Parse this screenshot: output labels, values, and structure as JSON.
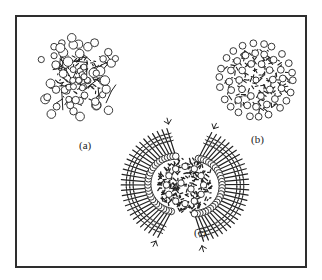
{
  "figure": {
    "panels": [
      {
        "id": "a",
        "label": "(a)",
        "style": "loose-network",
        "center": [
          79,
          80
        ],
        "radius": 46,
        "label_pos": [
          79,
          140
        ]
      },
      {
        "id": "b",
        "label": "(b)",
        "style": "compact-sphere",
        "center": [
          256,
          80
        ],
        "radius": 40,
        "label_pos": [
          251,
          134
        ]
      },
      {
        "id": "c",
        "label": "(c)",
        "style": "pinwheel-aggregate",
        "center": [
          185,
          185
        ],
        "radius": 62,
        "label_pos": [
          194,
          227
        ]
      }
    ]
  },
  "colors": {
    "frame": "#2e2e2e",
    "ink": "#222222",
    "bead_fill": "#ffffff"
  }
}
